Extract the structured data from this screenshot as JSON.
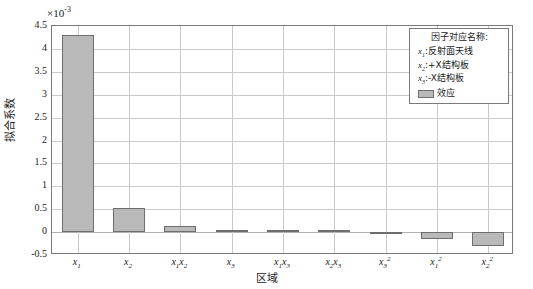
{
  "chart_data": {
    "type": "bar",
    "title": "",
    "xlabel": "区域",
    "ylabel": "拟合系数",
    "y_exponent_label": "×10",
    "y_exponent_value": "-3",
    "categories": [
      "x1",
      "x2",
      "x1x2",
      "x3",
      "x1x3",
      "x2x3",
      "x3^2",
      "x1^2",
      "x2^2"
    ],
    "category_labels": [
      {
        "base": "x",
        "sub": "1",
        "sup": "",
        "base2": "",
        "sub2": ""
      },
      {
        "base": "x",
        "sub": "2",
        "sup": "",
        "base2": "",
        "sub2": ""
      },
      {
        "base": "x",
        "sub": "1",
        "sup": "",
        "base2": "x",
        "sub2": "2"
      },
      {
        "base": "x",
        "sub": "3",
        "sup": "",
        "base2": "",
        "sub2": ""
      },
      {
        "base": "x",
        "sub": "1",
        "sup": "",
        "base2": "x",
        "sub2": "3"
      },
      {
        "base": "x",
        "sub": "2",
        "sup": "",
        "base2": "x",
        "sub2": "3"
      },
      {
        "base": "x",
        "sub": "3",
        "sup": "2",
        "base2": "",
        "sub2": ""
      },
      {
        "base": "x",
        "sub": "1",
        "sup": "2",
        "base2": "",
        "sub2": ""
      },
      {
        "base": "x",
        "sub": "2",
        "sup": "2",
        "base2": "",
        "sub2": ""
      }
    ],
    "values": [
      4.3,
      0.52,
      0.14,
      0.02,
      0.02,
      0.02,
      -0.04,
      -0.14,
      -0.3
    ],
    "value_unit": "1e-3",
    "ylim": [
      -0.5,
      4.5
    ],
    "yticks": [
      4.5,
      4,
      3.5,
      3,
      2.5,
      2,
      1.5,
      1,
      0.5,
      0,
      -0.5
    ],
    "ytick_labels": [
      "4.5",
      "4",
      "3.5",
      "3",
      "2.5",
      "2",
      "1.5",
      "1",
      "0.5",
      "0",
      "-0.5"
    ],
    "grid": true,
    "grid_vertical": true,
    "legend_position": "top-right",
    "series_name": "效应",
    "bar_color": "#b9b9b9",
    "bar_edge_color": "#6e6e6e",
    "grid_color": "#c9c9c9",
    "frame_color": "#7a7a7a"
  },
  "legend": {
    "title": "因子对应名称:",
    "entries": [
      {
        "var": "x",
        "sub": "1",
        "sep": ":",
        "desc": "反射面天线"
      },
      {
        "var": "x",
        "sub": "2",
        "sep": ":",
        "desc": "+X结构板"
      },
      {
        "var": "x",
        "sub": "3",
        "sep": ":",
        "desc": "-X结构板"
      }
    ],
    "swatch_label": "效应"
  }
}
